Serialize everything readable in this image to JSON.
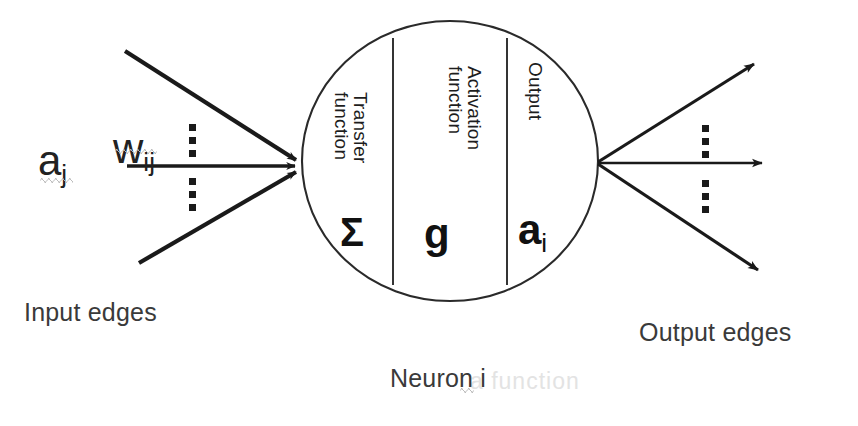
{
  "diagram": {
    "background_color": "#ffffff",
    "stroke_color": "#1a1a1a",
    "text_color": "#2b2b2b",
    "labels": {
      "input_edges": "Input edges",
      "output_edges": "Output edges",
      "neuron": "Neuron i",
      "neuron_base": "Neuron",
      "neuron_subscript": "i"
    },
    "inputs": {
      "activation_symbol": "a",
      "activation_subscript": "j",
      "weight_symbol": "w",
      "weight_subscript": "ij",
      "edge_count_shown": 3,
      "ellipsis": "⋮"
    },
    "outputs": {
      "edge_count_shown": 3,
      "ellipsis": "⋮"
    },
    "neuron": {
      "compartments": [
        {
          "id": "transfer",
          "caption_line1": "Transfer",
          "caption_line2": "function",
          "symbol": "Σ",
          "symbol_name": "sigma"
        },
        {
          "id": "activation",
          "caption_line1": "Activation",
          "caption_line2": "function",
          "symbol": "g",
          "symbol_name": "g"
        },
        {
          "id": "output",
          "caption_line1": "Output",
          "caption_line2": "",
          "symbol": "a",
          "symbol_subscript": "i",
          "symbol_name": "a-sub-i"
        }
      ]
    },
    "artifacts": {
      "ghost_text": "a function"
    }
  }
}
